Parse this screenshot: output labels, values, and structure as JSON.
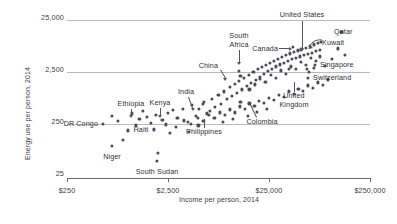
{
  "chart_data": {
    "type": "scatter",
    "title": "",
    "xlabel": "Income per person, 2014",
    "ylabel": "Energy use per person, 2014",
    "xscale": "log",
    "yscale": "log",
    "xticks": [
      "$250",
      "$2,500",
      "$25,000",
      "$250,000"
    ],
    "xtick_values": [
      250,
      2500,
      25000,
      250000
    ],
    "yticks": [
      "25,000",
      "2,500",
      "250",
      "25"
    ],
    "ytick_values": [
      25000,
      2500,
      250,
      25
    ],
    "xlim": [
      250,
      250000
    ],
    "ylim": [
      25,
      25000
    ],
    "grid": "horizontal",
    "legend": "none",
    "point_count": 148,
    "annotations": [
      {
        "label": "United States",
        "x": 52000,
        "y": 6900
      },
      {
        "label": "Qatar",
        "x": 130000,
        "y": 15000
      },
      {
        "label": "Kuwait",
        "x": 82000,
        "y": 9500
      },
      {
        "label": "Canada",
        "x": 43000,
        "y": 7800
      },
      {
        "label": "Singapore",
        "x": 80000,
        "y": 5100
      },
      {
        "label": "Switzerland",
        "x": 59000,
        "y": 2900
      },
      {
        "label": "South Africa",
        "x": 12500,
        "y": 2700
      },
      {
        "label": "China",
        "x": 13000,
        "y": 2200
      },
      {
        "label": "United Kingdom",
        "x": 39000,
        "y": 3000
      },
      {
        "label": "Colombia",
        "x": 13000,
        "y": 700
      },
      {
        "label": "India",
        "x": 5500,
        "y": 640
      },
      {
        "label": "Philippines",
        "x": 6500,
        "y": 470
      },
      {
        "label": "Kenya",
        "x": 2800,
        "y": 490
      },
      {
        "label": "Ethiopia",
        "x": 1400,
        "y": 470
      },
      {
        "label": "Haiti",
        "x": 1700,
        "y": 280
      },
      {
        "label": "DR Congo",
        "x": 700,
        "y": 380
      },
      {
        "label": "Niger",
        "x": 900,
        "y": 130
      },
      {
        "label": "South Sudan",
        "x": 2000,
        "y": 75
      }
    ],
    "points": [
      [
        700,
        380
      ],
      [
        900,
        130
      ],
      [
        2000,
        75
      ],
      [
        1400,
        470
      ],
      [
        2800,
        490
      ],
      [
        1700,
        280
      ],
      [
        5500,
        640
      ],
      [
        6500,
        470
      ],
      [
        13000,
        700
      ],
      [
        13000,
        2200
      ],
      [
        12500,
        2700
      ],
      [
        39000,
        3000
      ],
      [
        43000,
        7800
      ],
      [
        52000,
        6900
      ],
      [
        82000,
        9500
      ],
      [
        130000,
        15000
      ],
      [
        80000,
        5100
      ],
      [
        59000,
        2900
      ],
      [
        1300,
        330
      ],
      [
        1550,
        360
      ],
      [
        1900,
        400
      ],
      [
        2200,
        320
      ],
      [
        2500,
        430
      ],
      [
        3100,
        350
      ],
      [
        3500,
        520
      ],
      [
        3900,
        290
      ],
      [
        4300,
        600
      ],
      [
        4700,
        380
      ],
      [
        5100,
        520
      ],
      [
        5700,
        700
      ],
      [
        6100,
        420
      ],
      [
        6800,
        800
      ],
      [
        7300,
        560
      ],
      [
        7900,
        950
      ],
      [
        8400,
        640
      ],
      [
        9000,
        1100
      ],
      [
        9600,
        780
      ],
      [
        10200,
        1350
      ],
      [
        10800,
        900
      ],
      [
        11400,
        1550
      ],
      [
        12000,
        1050
      ],
      [
        12700,
        1750
      ],
      [
        13500,
        1200
      ],
      [
        14200,
        2000
      ],
      [
        15000,
        1400
      ],
      [
        15800,
        2300
      ],
      [
        16600,
        1600
      ],
      [
        17500,
        2600
      ],
      [
        18400,
        1850
      ],
      [
        19300,
        2900
      ],
      [
        20200,
        2100
      ],
      [
        21200,
        3200
      ],
      [
        22200,
        2400
      ],
      [
        23300,
        3500
      ],
      [
        24400,
        2700
      ],
      [
        25600,
        3800
      ],
      [
        26800,
        3000
      ],
      [
        28100,
        4200
      ],
      [
        29400,
        3300
      ],
      [
        30800,
        4600
      ],
      [
        32200,
        3600
      ],
      [
        33700,
        5000
      ],
      [
        35300,
        3900
      ],
      [
        36900,
        5400
      ],
      [
        38600,
        4200
      ],
      [
        40400,
        5800
      ],
      [
        42300,
        4500
      ],
      [
        44200,
        6200
      ],
      [
        46300,
        4800
      ],
      [
        48400,
        6600
      ],
      [
        50600,
        5100
      ],
      [
        52900,
        7000
      ],
      [
        55400,
        5400
      ],
      [
        58000,
        7500
      ],
      [
        60700,
        5700
      ],
      [
        63500,
        8000
      ],
      [
        66400,
        6000
      ],
      [
        69500,
        8600
      ],
      [
        72700,
        6400
      ],
      [
        76100,
        9200
      ],
      [
        79600,
        6800
      ],
      [
        1000,
        200
      ],
      [
        1200,
        250
      ],
      [
        1800,
        210
      ],
      [
        2400,
        260
      ],
      [
        3000,
        230
      ],
      [
        3600,
        310
      ],
      [
        4200,
        270
      ],
      [
        4900,
        350
      ],
      [
        5600,
        300
      ],
      [
        6400,
        390
      ],
      [
        7200,
        340
      ],
      [
        8100,
        440
      ],
      [
        9100,
        390
      ],
      [
        10200,
        500
      ],
      [
        11400,
        440
      ],
      [
        12800,
        570
      ],
      [
        14300,
        510
      ],
      [
        16000,
        650
      ],
      [
        17900,
        580
      ],
      [
        20000,
        740
      ],
      [
        22400,
        660
      ],
      [
        25000,
        840
      ],
      [
        28000,
        760
      ],
      [
        31300,
        960
      ],
      [
        35000,
        870
      ],
      [
        39100,
        1100
      ],
      [
        43700,
        990
      ],
      [
        48800,
        1250
      ],
      [
        54600,
        1130
      ],
      [
        61000,
        1430
      ],
      [
        68200,
        1290
      ],
      [
        76200,
        1630
      ],
      [
        85200,
        1470
      ],
      [
        95200,
        1860
      ],
      [
        16000,
        1200
      ],
      [
        18000,
        1500
      ],
      [
        20500,
        1900
      ],
      [
        23000,
        1650
      ],
      [
        26000,
        2250
      ],
      [
        29500,
        2000
      ],
      [
        33000,
        2750
      ],
      [
        37000,
        2400
      ],
      [
        41500,
        3300
      ],
      [
        46500,
        2900
      ],
      [
        52000,
        4000
      ],
      [
        58500,
        3500
      ],
      [
        65500,
        4800
      ],
      [
        73500,
        4200
      ],
      [
        800,
        300
      ],
      [
        1100,
        420
      ],
      [
        2600,
        180
      ],
      [
        4000,
        190
      ],
      [
        5000,
        250
      ],
      [
        8800,
        290
      ],
      [
        11000,
        330
      ],
      [
        15500,
        380
      ],
      [
        19000,
        450
      ],
      [
        24000,
        520
      ],
      [
        120000,
        7200
      ],
      [
        105000,
        4600
      ],
      [
        90000,
        3400
      ],
      [
        140000,
        5500
      ],
      [
        62000,
        2600
      ],
      [
        70000,
        3100
      ]
    ]
  },
  "axis": {
    "y_title": "Energy use per person, 2014",
    "x_title": "Income per person, 2014"
  }
}
